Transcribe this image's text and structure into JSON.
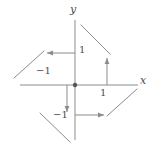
{
  "figure": {
    "width": 156,
    "height": 153,
    "background": "#ffffff",
    "stroke_color": "#8c8c8c",
    "text_color": "#4d4d4d",
    "origin": {
      "x": 75,
      "y": 85
    },
    "unit_px": 32
  },
  "axes": {
    "x_axis": {
      "label": "x",
      "label_pos": {
        "x": 140,
        "y": 75
      },
      "line": {
        "x1": 20,
        "y1": 85,
        "x2": 138,
        "y2": 85
      }
    },
    "y_axis": {
      "label": "y",
      "label_pos": {
        "x": 70,
        "y": 4
      },
      "line": {
        "x1": 75,
        "y1": 20,
        "x2": 75,
        "y2": 140
      }
    },
    "origin_dot": {
      "cx": 75,
      "cy": 85,
      "r": 2.2
    }
  },
  "ticks": [
    {
      "name": "y-positive-one",
      "text": "1",
      "x": 79,
      "y": 45,
      "axis": "y",
      "value": 1
    },
    {
      "name": "y-negative-one",
      "text": "−1",
      "x": 53,
      "y": 110,
      "axis": "y",
      "value": -1
    },
    {
      "name": "x-positive-one",
      "text": "1",
      "x": 100,
      "y": 88,
      "axis": "x",
      "value": 1
    },
    {
      "name": "x-negative-one",
      "text": "−1",
      "x": 36,
      "y": 66,
      "axis": "x",
      "value": -1
    }
  ],
  "arrows": [
    {
      "name": "arrow-upper-left",
      "from": {
        "x": 75,
        "y": 53
      },
      "to": {
        "x": 46,
        "y": 53
      },
      "direction": "left",
      "description": "horizontal arrow at y = 1 pointing in the negative x direction"
    },
    {
      "name": "arrow-upper-right",
      "from": {
        "x": 107,
        "y": 85
      },
      "to": {
        "x": 107,
        "y": 57
      },
      "direction": "up",
      "description": "vertical arrow at x = 1 pointing in the positive y direction"
    },
    {
      "name": "arrow-lower-left",
      "from": {
        "x": 67,
        "y": 85
      },
      "to": {
        "x": 67,
        "y": 113
      },
      "direction": "down",
      "description": "vertical arrow at x just left of origin pointing in the negative y direction"
    },
    {
      "name": "arrow-lower-right",
      "from": {
        "x": 75,
        "y": 115
      },
      "to": {
        "x": 105,
        "y": 115
      },
      "direction": "right",
      "description": "horizontal arrow at y = -1 pointing in the positive x direction"
    }
  ],
  "diagonals": [
    {
      "name": "diagonal-upper-left",
      "from": {
        "x": 44,
        "y": 51
      },
      "to": {
        "x": 14,
        "y": 78
      },
      "description": "segment in the second quadrant sloping down to the left"
    },
    {
      "name": "diagonal-upper-right",
      "from": {
        "x": 81,
        "y": 25
      },
      "to": {
        "x": 110,
        "y": 54
      },
      "description": "segment in the first quadrant sloping down to the right"
    },
    {
      "name": "diagonal-lower-left",
      "from": {
        "x": 40,
        "y": 113
      },
      "to": {
        "x": 70,
        "y": 142
      },
      "description": "segment in the third quadrant sloping down to the right"
    },
    {
      "name": "diagonal-lower-right",
      "from": {
        "x": 107,
        "y": 116
      },
      "to": {
        "x": 137,
        "y": 89
      },
      "description": "segment in the fourth quadrant sloping up to the right"
    }
  ]
}
